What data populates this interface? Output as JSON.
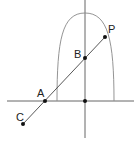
{
  "labels": {
    "P": "P",
    "B": "B",
    "A": "A",
    "C": "C"
  },
  "colors": {
    "stroke": "#444444",
    "curve": "#888888",
    "point": "#111111"
  }
}
